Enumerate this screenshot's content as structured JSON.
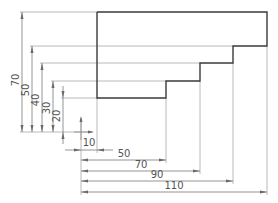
{
  "drawing": {
    "part_outline_points": "97,12 267,12 267,46 233,46 233,63 200,63 200,81 166,81 166,98 97,98 97,12",
    "colors": {
      "outline": "#3a3a3a",
      "extension": "#a8a8a8",
      "dimension": "#7a7a7a",
      "text": "#555555"
    },
    "origin_marker": {
      "x": 81,
      "y": 132
    },
    "vertical_dimensions": [
      {
        "label": "70",
        "x": 22,
        "y1": 12,
        "y2": 132
      },
      {
        "label": "50",
        "x": 32,
        "y1": 46,
        "y2": 132
      },
      {
        "label": "40",
        "x": 42,
        "y1": 63,
        "y2": 132
      },
      {
        "label": "30",
        "x": 53,
        "y1": 81,
        "y2": 132
      },
      {
        "label": "20",
        "x": 63,
        "y1": 98,
        "y2": 132
      }
    ],
    "horizontal_dimensions": [
      {
        "label": "10",
        "y": 150,
        "x1": 81,
        "x2": 97
      },
      {
        "label": "50",
        "y": 160,
        "x1": 81,
        "x2": 166
      },
      {
        "label": "70",
        "y": 171,
        "x1": 81,
        "x2": 200
      },
      {
        "label": "90",
        "y": 181,
        "x1": 81,
        "x2": 233
      },
      {
        "label": "110",
        "y": 192,
        "x1": 81,
        "x2": 267
      }
    ]
  }
}
